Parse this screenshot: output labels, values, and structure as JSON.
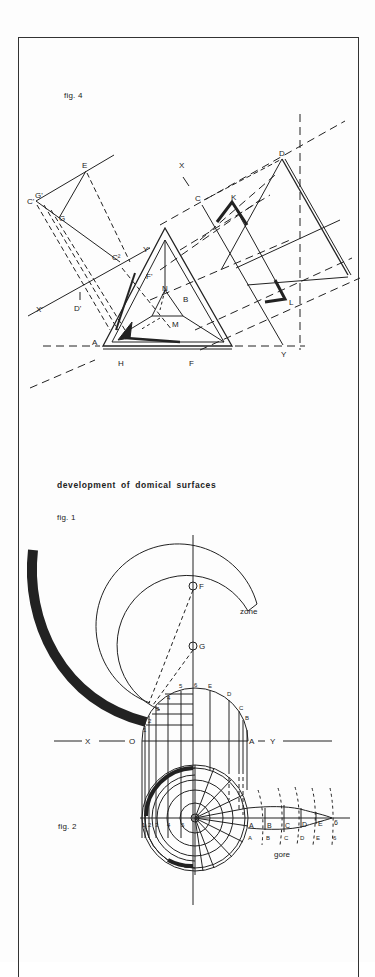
{
  "page": {
    "heading": "development of domical surfaces",
    "figures": [
      {
        "id": "fig4",
        "caption": "fig. 4",
        "point_labels": [
          "E",
          "C'",
          "G'",
          "G",
          "C²",
          "Y'",
          "X'",
          "D'",
          "F'",
          "N",
          "B",
          "M",
          "A",
          "H",
          "F",
          "X",
          "C",
          "K",
          "D",
          "L",
          "Y"
        ]
      },
      {
        "id": "fig1",
        "caption": "fig. 1",
        "point_labels": [
          "F",
          "G",
          "zone",
          "1",
          "2",
          "3",
          "4",
          "5",
          "6",
          "E",
          "D",
          "C",
          "B",
          "A",
          "O",
          "X",
          "Y"
        ],
        "axis_labels": {
          "x": "X",
          "origin": "O",
          "a": "A",
          "y": "Y"
        },
        "zone_label": "zone"
      },
      {
        "id": "fig2",
        "caption": "fig. 2",
        "radial_labels": [
          "1",
          "2",
          "3",
          "4",
          "5"
        ],
        "gore_points_upper": [
          "A",
          "B",
          "C",
          "D",
          "E",
          "6"
        ],
        "gore_points_lower": [
          "A",
          "B",
          "C",
          "D",
          "E",
          "6"
        ],
        "gore_label": "gore"
      }
    ]
  },
  "colors": {
    "ink": "#222222",
    "paper": "#fdfdfd",
    "frame": "#333333"
  }
}
